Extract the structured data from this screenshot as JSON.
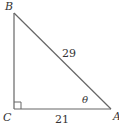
{
  "diagram": {
    "type": "right-triangle",
    "stroke_color": "#666666",
    "label_color": "#333333",
    "vertices": {
      "B": {
        "label": "B",
        "x": 14,
        "y": 13
      },
      "C": {
        "label": "C",
        "x": 14,
        "y": 109
      },
      "A": {
        "label": "A",
        "x": 111,
        "y": 109
      }
    },
    "right_angle_at": "C",
    "angle_label": "θ",
    "sides": {
      "hypotenuse": {
        "from": "B",
        "to": "A",
        "label": "29"
      },
      "base": {
        "from": "C",
        "to": "A",
        "label": "21"
      },
      "vertical": {
        "from": "B",
        "to": "C",
        "label": ""
      }
    }
  }
}
